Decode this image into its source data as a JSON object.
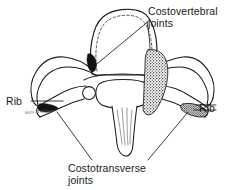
{
  "figure": {
    "background_color": "#ffffff",
    "ink_color": "#1a1a1a"
  },
  "labels": {
    "costovertebral": "Costovertebral\njoints",
    "costotransverse": "Costotransverse\njoints",
    "rib_left": "Rib",
    "rib_right": "Rib",
    "signature": "Sam M Wilson"
  },
  "anatomy": {
    "vertebral_body": "vertebral-body",
    "vertebral_foramen": "vertebral-foramen",
    "spinous_process": "spinous-process",
    "transverse_process_left": "transverse-process-left",
    "transverse_process_right": "transverse-process-right",
    "rib_left": "rib-left",
    "rib_right": "rib-right",
    "superior_articular_facet_left": "superior-articular-facet-left",
    "superior_articular_facet_right": "superior-articular-facet-right",
    "costovertebral_joint_marking": "costovertebral-joint-marking",
    "costotransverse_joint_marking": "costotransverse-joint-marking"
  }
}
